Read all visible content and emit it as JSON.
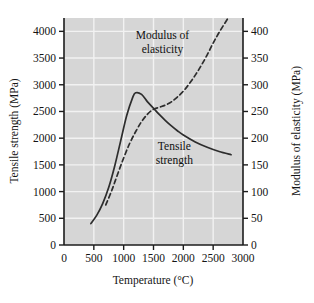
{
  "chart_data": {
    "type": "line",
    "title": "",
    "xlabel": "Temperature (°C)",
    "ylabel": "Tensile strength (MPa)",
    "y2label": "Modulus of elasticity (MPa)",
    "xlim": [
      0,
      3000
    ],
    "ylim": [
      0,
      4250
    ],
    "y2lim": [
      0,
      425
    ],
    "grid": true,
    "legend": "annotations-inline",
    "xticks": [
      0,
      500,
      1000,
      1500,
      2000,
      2500,
      3000
    ],
    "xticklabels": [
      "0",
      "500",
      "1000",
      "1500",
      "2000",
      "2500",
      "3000"
    ],
    "yticks": [
      0,
      500,
      1000,
      1500,
      2000,
      2500,
      3000,
      3500,
      4000
    ],
    "yticklabels": [
      "0",
      "500",
      "1000",
      "1500",
      "2000",
      "2500",
      "3000",
      "3500",
      "4000"
    ],
    "y2ticks": [
      0,
      50,
      100,
      150,
      200,
      250,
      300,
      350,
      400
    ],
    "y2ticklabels": [
      "0",
      "50",
      "100",
      "150",
      "200",
      "250",
      "300",
      "350",
      "400"
    ],
    "series": [
      {
        "name": "Tensile strength",
        "axis": "left",
        "style": "solid",
        "color": "#2d2d2d",
        "x": [
          450,
          550,
          650,
          750,
          850,
          950,
          1050,
          1150,
          1200,
          1300,
          1400,
          1500,
          1600,
          1700,
          1800,
          1900,
          2000,
          2200,
          2400,
          2600,
          2800
        ],
        "values": [
          400,
          560,
          780,
          1080,
          1480,
          1950,
          2420,
          2760,
          2850,
          2820,
          2680,
          2560,
          2440,
          2330,
          2230,
          2140,
          2060,
          1930,
          1830,
          1750,
          1690
        ]
      },
      {
        "name": "Modulus of elasticity",
        "axis": "right",
        "style": "dashed",
        "color": "#2d2d2d",
        "x": [
          700,
          800,
          900,
          1000,
          1100,
          1200,
          1300,
          1400,
          1500,
          1600,
          1700,
          1800,
          1900,
          2000,
          2100,
          2200,
          2300,
          2400,
          2500,
          2600,
          2750
        ],
        "values": [
          75,
          102,
          133,
          163,
          190,
          212,
          231,
          245,
          254,
          258,
          262,
          268,
          277,
          288,
          302,
          318,
          336,
          356,
          378,
          398,
          425
        ]
      }
    ],
    "annotations": [
      {
        "text_line1": "Modulus of",
        "text_line2": "elasticity",
        "x": 1650,
        "y": 3850
      },
      {
        "text_line1": "Tensile",
        "text_line2": "strength",
        "x": 1850,
        "y": 1780
      }
    ],
    "colors": {
      "plot_background": "#d6d6d6",
      "gridline": "#f2f2f2",
      "axis": "#1c1c1c",
      "text": "#141414",
      "figure_background": "#ffffff"
    }
  }
}
